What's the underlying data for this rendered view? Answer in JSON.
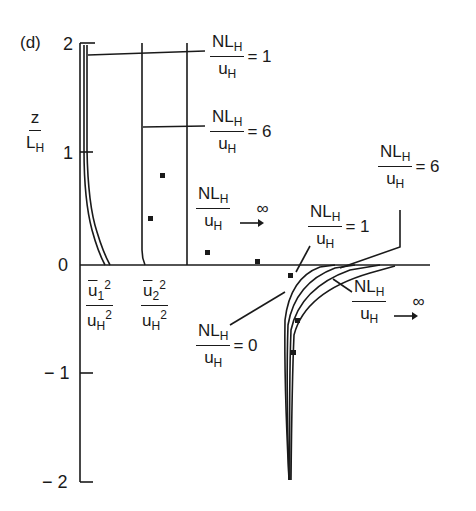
{
  "panel_label": "(d)",
  "axis": {
    "ylabel_num": "z",
    "ylabel_den_base": "L",
    "ylabel_den_sub": "H",
    "ticks": [
      "2",
      "1",
      "0",
      "− 1",
      "− 2"
    ]
  },
  "xlabels": {
    "u1": {
      "num_base": "u",
      "num_sub": "1",
      "num_sup": "2",
      "den_base": "u",
      "den_sub": "H",
      "den_sup": "2"
    },
    "u2": {
      "num_base": "u",
      "num_sub": "2",
      "num_sup": "2",
      "den_base": "u",
      "den_sub": "H",
      "den_sup": "2"
    }
  },
  "annotations": {
    "upper_1": {
      "num": "NL",
      "num_sub": "H",
      "den": "u",
      "den_sub": "H",
      "rhs": "= 1"
    },
    "upper_6": {
      "num": "NL",
      "num_sub": "H",
      "den": "u",
      "den_sub": "H",
      "rhs": "= 6"
    },
    "upper_inf": {
      "num": "NL",
      "num_sub": "H",
      "den": "u",
      "den_sub": "H",
      "rhs": "→ ∞"
    },
    "lower_6": {
      "num": "NL",
      "num_sub": "H",
      "den": "u",
      "den_sub": "H",
      "rhs": "= 6"
    },
    "lower_1": {
      "num": "NL",
      "num_sub": "H",
      "den": "u",
      "den_sub": "H",
      "rhs": "= 1"
    },
    "lower_0": {
      "num": "NL",
      "num_sub": "H",
      "den": "u",
      "den_sub": "H",
      "rhs": "= 0"
    },
    "lower_inf": {
      "num": "NL",
      "num_sub": "H",
      "den": "u",
      "den_sub": "H",
      "rhs": "→ ∞"
    }
  },
  "colors": {
    "ink": "#1a1a1a",
    "background": "#ffffff"
  }
}
